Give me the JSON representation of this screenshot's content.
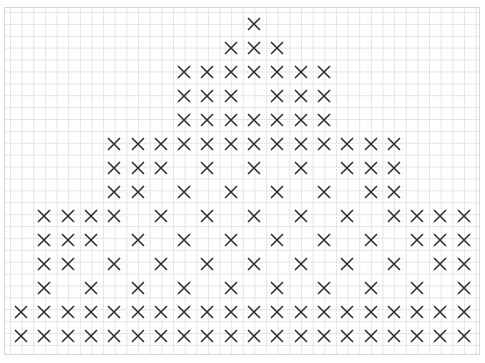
{
  "pattern": {
    "symbol": "X",
    "stroke_color": "#2a2a2a",
    "grid_color": "#e4e4e4",
    "origin_x": 21,
    "origin_y": 24,
    "step_x": 23.3,
    "step_y": 24.0,
    "columns": 20,
    "rows": [
      [
        10
      ],
      [
        9,
        10,
        11
      ],
      [
        7,
        8,
        9,
        10,
        11,
        12,
        13
      ],
      [
        7,
        8,
        9,
        11,
        12,
        13
      ],
      [
        7,
        8,
        9,
        10,
        11,
        12,
        13
      ],
      [
        4,
        5,
        6,
        7,
        8,
        9,
        10,
        11,
        12,
        13,
        14,
        15,
        16
      ],
      [
        4,
        5,
        6,
        8,
        10,
        12,
        14,
        15,
        16
      ],
      [
        4,
        5,
        7,
        9,
        11,
        13,
        15,
        16
      ],
      [
        1,
        2,
        3,
        4,
        6,
        8,
        10,
        12,
        14,
        16,
        17,
        18,
        19
      ],
      [
        1,
        2,
        3,
        5,
        7,
        9,
        11,
        13,
        15,
        17,
        18,
        19
      ],
      [
        1,
        2,
        4,
        6,
        8,
        10,
        12,
        14,
        16,
        18,
        19
      ],
      [
        1,
        3,
        5,
        7,
        9,
        11,
        13,
        15,
        17,
        19
      ],
      [
        0,
        1,
        2,
        3,
        4,
        5,
        6,
        7,
        8,
        9,
        10,
        11,
        12,
        13,
        14,
        15,
        16,
        17,
        18,
        19
      ],
      [
        0,
        1,
        2,
        3,
        4,
        5,
        6,
        7,
        8,
        9,
        10,
        11,
        12,
        13,
        14,
        15,
        16,
        17,
        18,
        19
      ]
    ]
  }
}
